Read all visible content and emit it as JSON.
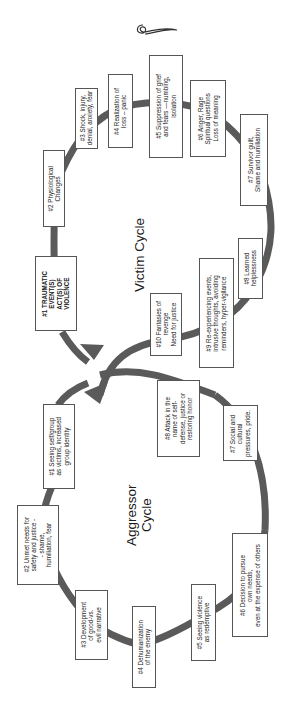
{
  "ornament": "flourish-icon",
  "victim_cycle": {
    "title": "Victim Cycle",
    "steps": [
      {
        "label": "#1 TRAUMATIC\nEVENT(S)\nACT(S) OF\nVIOLENCE"
      },
      {
        "label": "#2 Physiological\nChanges"
      },
      {
        "label": "#3 Shock, injury,\ndenial, anxiety, fear"
      },
      {
        "label": "#4 Realization of\nloss – panic"
      },
      {
        "label": "#5 Suppression of grief\nand fears —numbing,\nisolation"
      },
      {
        "label": "#6 Anger, Rage\nSpiritual questions\nLoss of meaning"
      },
      {
        "label": "#7 Survivor guilt,\nShame and humiliation"
      },
      {
        "label": "#8 Learned\nhelplessness"
      },
      {
        "label": "#9 Re-experiencing events,\nintrusive thoughts, avoiding\nreminders, hyper-vigilance"
      },
      {
        "label": "#10 Fantasies of\nrevenge\nNeed for justice"
      }
    ]
  },
  "aggressor_cycle": {
    "title": "Aggressor\nCycle",
    "steps": [
      {
        "label": "#1 Seeing self/group\nas victims, increased\ngroup identity"
      },
      {
        "label": "#2 Unmet needs for\nsafety and justice -\n- shame,\nhumiliation, fear"
      },
      {
        "label": "#3 Development\nof good-vs.\nevil narrative"
      },
      {
        "label": "#4 Dehumanization\nof the enemy"
      },
      {
        "label": "#5 Seeing violence\nas redemptive"
      },
      {
        "label": "#6 Decision to pursue\nown needs,\neven at the expense of others"
      },
      {
        "label": "#7 Social and\ncultural\npressures, pride."
      },
      {
        "label": "#8 Attack in the\nname of self-\ndefense, justice or\nrestoring honor"
      }
    ]
  },
  "colors": {
    "ring": "#555555",
    "box_border": "#555555",
    "text": "#222222",
    "background": "#ffffff"
  }
}
